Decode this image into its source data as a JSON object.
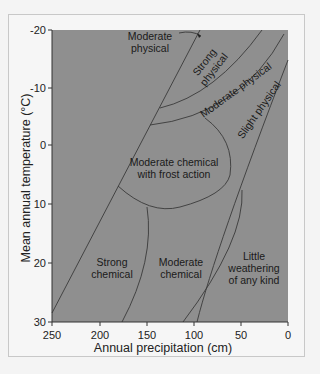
{
  "diagram": {
    "type": "weathering regime diagram",
    "colors": {
      "plot_fill": "#8f8f8f",
      "line": "#3a3a3a",
      "frame_bg": "#f6f6f6"
    },
    "x_axis": {
      "label": "Annual precipitation (cm)",
      "ticks": [
        "250",
        "200",
        "150",
        "100",
        "50",
        "0"
      ]
    },
    "y_axis": {
      "label": "Mean annual temperature (°C)",
      "ticks": [
        "-20",
        "-10",
        "0",
        "10",
        "20",
        "30"
      ]
    },
    "regions": {
      "moderate_physical_top": [
        "Moderate",
        "physical"
      ],
      "strong_physical": [
        "Strong",
        "physical"
      ],
      "moderate_physical_band": "Moderate physical",
      "slight_physical": "Slight physical",
      "moderate_chemical_frost": [
        "Moderate chemical",
        "with frost action"
      ],
      "strong_chemical": [
        "Strong",
        "chemical"
      ],
      "moderate_chemical": [
        "Moderate",
        "chemical"
      ],
      "little_weathering": [
        "Little",
        "weathering",
        "of any kind"
      ]
    }
  }
}
